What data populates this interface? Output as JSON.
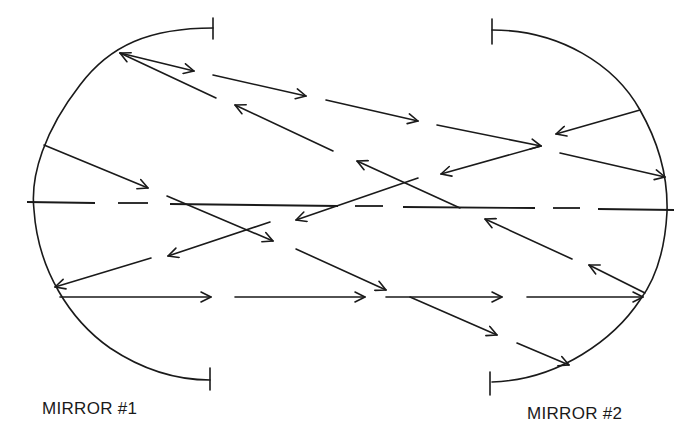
{
  "diagram": {
    "title": "",
    "labels": {
      "mirror1": "MIRROR #1",
      "mirror2": "MIRROR #2"
    },
    "colors": {
      "ink": "#1a1a1a",
      "background": "#ffffff"
    },
    "elements": {
      "mirrors": [
        {
          "id": "mirror-1",
          "side": "left",
          "shape": "concave-arc"
        },
        {
          "id": "mirror-2",
          "side": "right",
          "shape": "concave-arc"
        }
      ],
      "optical_axis": {
        "style": "dashed",
        "orientation": "horizontal"
      },
      "ray_count": 22
    }
  }
}
